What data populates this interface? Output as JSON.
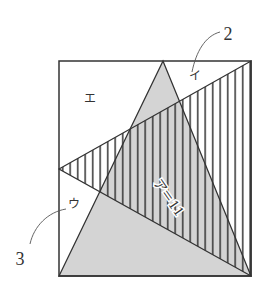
{
  "diagram": {
    "type": "geometry-figure",
    "colors": {
      "stroke": "#333333",
      "shade": "#d4d4d4",
      "hatch": "#333333",
      "background": "#ffffff"
    },
    "square": {
      "x1": 59,
      "y1": 61,
      "x2": 251,
      "y2": 276
    },
    "shaded_triangle": {
      "points": "163,61 59,276 251,276"
    },
    "hatched_triangle": {
      "points": "59,169 251,61 251,276"
    },
    "labels": {
      "region_a": "ア＝11",
      "region_i": "イ",
      "region_u": "ウ",
      "region_e": "エ",
      "callout_2": "2",
      "callout_3": "3"
    }
  }
}
